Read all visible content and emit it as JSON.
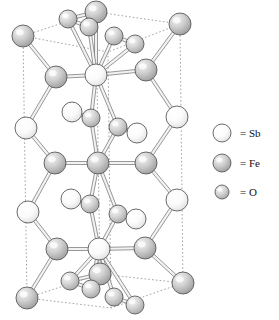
{
  "figure": {
    "kind": "crystal-structure-diagram",
    "background_color": "#ffffff"
  },
  "legend": {
    "items": [
      {
        "key": "sb",
        "symbol": "= Sb",
        "element": "Sb",
        "sphere_color": "#fdfdfd",
        "radius": 9
      },
      {
        "key": "fe",
        "symbol": "= Fe",
        "element": "Fe",
        "sphere_color": "#b9b9b9",
        "radius": 9
      },
      {
        "key": "o",
        "symbol": "= O",
        "element": "O",
        "sphere_color": "#c3c3c3",
        "radius": 7
      }
    ],
    "x_sphere": 222,
    "x_text": 240,
    "y_positions": [
      133,
      163,
      192
    ]
  },
  "palette": {
    "sb_fill": "#fdfdfd",
    "sb_shade": "#e6e6e6",
    "fe_fill": "#cfcfcf",
    "fe_shade": "#9a9a9a",
    "o_fill": "#d6d6d6",
    "o_shade": "#a5a5a5",
    "outline": "#5a5a5a",
    "bond_fill": "#f2f2f2",
    "bond_edge": "#6e6e6e",
    "cell_edge": "#8a8a8a"
  },
  "cell": {
    "edge_style": "dotted",
    "top_face": [
      [
        23,
        36
      ],
      [
        96,
        12
      ],
      [
        180,
        24
      ],
      [
        108,
        52
      ]
    ],
    "bottom_face": [
      [
        27,
        298
      ],
      [
        100,
        274
      ],
      [
        183,
        283
      ],
      [
        111,
        308
      ]
    ],
    "verticals": [
      [
        [
          23,
          36
        ],
        [
          27,
          298
        ]
      ],
      [
        [
          96,
          12
        ],
        [
          100,
          274
        ]
      ],
      [
        [
          180,
          24
        ],
        [
          183,
          283
        ]
      ],
      [
        [
          108,
          52
        ],
        [
          111,
          308
        ]
      ]
    ]
  },
  "atoms": {
    "corners": [
      {
        "id": "c-tl",
        "el": "fe",
        "x": 23,
        "y": 36,
        "r": 11
      },
      {
        "id": "c-tb",
        "el": "fe",
        "x": 96,
        "y": 12,
        "r": 11
      },
      {
        "id": "c-tr",
        "el": "fe",
        "x": 180,
        "y": 24,
        "r": 11
      },
      {
        "id": "c-bl",
        "el": "fe",
        "x": 27,
        "y": 298,
        "r": 11
      },
      {
        "id": "c-bb",
        "el": "fe",
        "x": 100,
        "y": 274,
        "r": 11
      },
      {
        "id": "c-br",
        "el": "fe",
        "x": 183,
        "y": 283,
        "r": 11
      }
    ],
    "axis": [
      {
        "id": "ax-1",
        "el": "sb",
        "x": 96,
        "y": 75,
        "r": 11
      },
      {
        "id": "ax-2",
        "el": "fe",
        "x": 98,
        "y": 163,
        "r": 11
      },
      {
        "id": "ax-3",
        "el": "sb",
        "x": 99,
        "y": 249,
        "r": 11
      }
    ],
    "ring_left": [
      {
        "id": "rl-1",
        "el": "fe",
        "x": 56,
        "y": 77,
        "r": 11
      },
      {
        "id": "rl-2",
        "el": "sb",
        "x": 26,
        "y": 128,
        "r": 11
      },
      {
        "id": "rl-3",
        "el": "fe",
        "x": 55,
        "y": 163,
        "r": 11
      },
      {
        "id": "rl-4",
        "el": "sb",
        "x": 28,
        "y": 212,
        "r": 11
      },
      {
        "id": "rl-5",
        "el": "fe",
        "x": 57,
        "y": 249,
        "r": 11
      }
    ],
    "ring_right": [
      {
        "id": "rr-1",
        "el": "fe",
        "x": 146,
        "y": 70,
        "r": 11
      },
      {
        "id": "rr-2",
        "el": "sb",
        "x": 177,
        "y": 117,
        "r": 11
      },
      {
        "id": "rr-3",
        "el": "fe",
        "x": 146,
        "y": 163,
        "r": 11
      },
      {
        "id": "rr-4",
        "el": "sb",
        "x": 177,
        "y": 200,
        "r": 11
      },
      {
        "id": "rr-5",
        "el": "fe",
        "x": 145,
        "y": 248,
        "r": 11
      }
    ],
    "oxygen": [
      {
        "id": "o-t1",
        "el": "o",
        "x": 68,
        "y": 19,
        "r": 9
      },
      {
        "id": "o-t2",
        "el": "o",
        "x": 89,
        "y": 27,
        "r": 9
      },
      {
        "id": "o-t3",
        "el": "o",
        "x": 114,
        "y": 36,
        "r": 9
      },
      {
        "id": "o-t4",
        "el": "o",
        "x": 135,
        "y": 44,
        "r": 9
      },
      {
        "id": "o-m1",
        "el": "o",
        "x": 91,
        "y": 118,
        "r": 9
      },
      {
        "id": "o-m2",
        "el": "o",
        "x": 118,
        "y": 127,
        "r": 9
      },
      {
        "id": "o-m3",
        "el": "o",
        "x": 90,
        "y": 204,
        "r": 9
      },
      {
        "id": "o-m4",
        "el": "o",
        "x": 118,
        "y": 214,
        "r": 9
      },
      {
        "id": "o-b1",
        "el": "o",
        "x": 70,
        "y": 281,
        "r": 9
      },
      {
        "id": "o-b2",
        "el": "o",
        "x": 91,
        "y": 289,
        "r": 9
      },
      {
        "id": "o-b3",
        "el": "o",
        "x": 114,
        "y": 297,
        "r": 9
      },
      {
        "id": "o-b4",
        "el": "o",
        "x": 135,
        "y": 305,
        "r": 9
      }
    ],
    "interstitial_sb": [
      {
        "id": "is-1",
        "el": "sb",
        "x": 72,
        "y": 112,
        "r": 10
      },
      {
        "id": "is-2",
        "el": "sb",
        "x": 137,
        "y": 133,
        "r": 10
      },
      {
        "id": "is-3",
        "el": "sb",
        "x": 71,
        "y": 199,
        "r": 10
      },
      {
        "id": "is-4",
        "el": "sb",
        "x": 136,
        "y": 219,
        "r": 10
      }
    ]
  },
  "bonds": [
    [
      "c-tl",
      "rl-1"
    ],
    [
      "c-tb",
      "ax-1"
    ],
    [
      "c-tr",
      "rr-1"
    ],
    [
      "rl-1",
      "ax-1"
    ],
    [
      "ax-1",
      "rr-1"
    ],
    [
      "rl-1",
      "rl-2"
    ],
    [
      "rl-2",
      "rl-3"
    ],
    [
      "rl-3",
      "rl-4"
    ],
    [
      "rl-4",
      "rl-5"
    ],
    [
      "rr-1",
      "rr-2"
    ],
    [
      "rr-2",
      "rr-3"
    ],
    [
      "rr-3",
      "rr-4"
    ],
    [
      "rr-4",
      "rr-5"
    ],
    [
      "rl-3",
      "ax-2"
    ],
    [
      "ax-2",
      "rr-3"
    ],
    [
      "rl-5",
      "ax-3"
    ],
    [
      "ax-3",
      "rr-5"
    ],
    [
      "rl-5",
      "c-bl"
    ],
    [
      "ax-3",
      "c-bb"
    ],
    [
      "rr-5",
      "c-br"
    ],
    [
      "ax-1",
      "o-t1"
    ],
    [
      "ax-1",
      "o-t2"
    ],
    [
      "ax-1",
      "o-t3"
    ],
    [
      "ax-1",
      "o-t4"
    ],
    [
      "ax-1",
      "o-m1"
    ],
    [
      "ax-1",
      "o-m2"
    ],
    [
      "ax-2",
      "o-m1"
    ],
    [
      "ax-2",
      "o-m2"
    ],
    [
      "ax-2",
      "o-m3"
    ],
    [
      "ax-2",
      "o-m4"
    ],
    [
      "ax-3",
      "o-m3"
    ],
    [
      "ax-3",
      "o-m4"
    ],
    [
      "ax-3",
      "o-b1"
    ],
    [
      "ax-3",
      "o-b2"
    ],
    [
      "ax-3",
      "o-b3"
    ],
    [
      "ax-3",
      "o-b4"
    ],
    [
      "o-t1",
      "c-tb"
    ],
    [
      "o-t2",
      "c-tb"
    ],
    [
      "o-b1",
      "c-bb"
    ],
    [
      "o-b2",
      "c-bb"
    ],
    [
      "is-1",
      "o-m1"
    ],
    [
      "is-2",
      "o-m2"
    ],
    [
      "is-3",
      "o-m3"
    ],
    [
      "is-4",
      "o-m4"
    ],
    [
      "o-t3",
      "o-t4"
    ],
    [
      "o-b3",
      "o-b4"
    ],
    [
      "o-t1",
      "o-t2"
    ],
    [
      "o-b1",
      "o-b2"
    ]
  ]
}
